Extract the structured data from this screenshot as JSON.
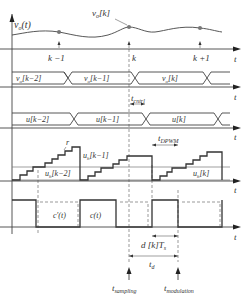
{
  "diagram": {
    "type": "timing-diagram",
    "panels": [
      {
        "id": "sampled",
        "signal_label": "v_o(t)",
        "sample_label": "v_o[k]",
        "ticks": [
          "k-1",
          "k",
          "k+1"
        ],
        "axis_label": "t"
      },
      {
        "id": "vo_estimates",
        "segments": [
          "v_o^e[k-2]",
          "v_o^e[k-1]",
          "v_o^e[k]"
        ],
        "axis_label": "t",
        "annotation": "t_cntrl"
      },
      {
        "id": "u_values",
        "segments": [
          "u[k-2]",
          "u[k-1]",
          "u[k]"
        ],
        "axis_label": "t",
        "annotation": "t_DPWM"
      },
      {
        "id": "staircase",
        "labels": [
          "u_h[k-1]",
          "u_h[k-2]",
          "u_h[k]",
          "r"
        ],
        "axis_label": "t"
      },
      {
        "id": "carrier",
        "labels": [
          "c'(t)",
          "c(t)"
        ],
        "axis_label": "t",
        "annotations": [
          "d[k]T_s",
          "t_d"
        ]
      }
    ],
    "bottom_labels": {
      "sampling": "t_sampling",
      "modulation": "t_modulation"
    }
  },
  "labels": {
    "vo_t": "v",
    "vo_t_sub": "o",
    "vo_t_arg": "(t)",
    "vok": "v",
    "vok_sub": "o",
    "vok_arg": "[k]",
    "km1": "k −1",
    "k": "k",
    "kp1": "k +1",
    "t": "t",
    "seg_vo": [
      "[k−2]",
      "[k−1]",
      "[k]"
    ],
    "seg_u": [
      "u[k−2]",
      "u[k−1]",
      "u[k]"
    ],
    "tcntrl": "cntrl",
    "tdpwm": "DPWM",
    "uh_km1": "[k−1]",
    "uh_km2": "[k−2]",
    "uh_k": "[k]",
    "r": "r",
    "cprime": "c′(t)",
    "c": "c(t)",
    "dkts": "d [k]T",
    "dkts_sub": "s",
    "td_sub": "d",
    "tsampling": "sampling",
    "tmodulation": "modulation"
  }
}
